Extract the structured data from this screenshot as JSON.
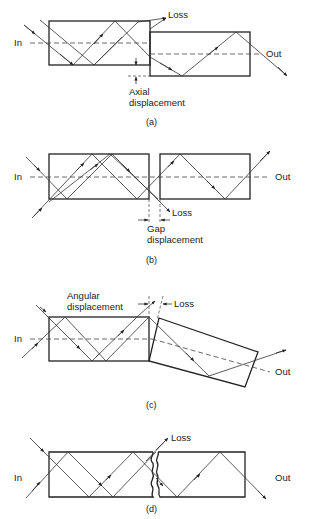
{
  "figure": {
    "panels": [
      {
        "id": "a",
        "caption": "(a)",
        "labels": {
          "in": "In",
          "out": "Out",
          "loss": "Loss",
          "displacement_line1": "Axial",
          "displacement_line2": "displacement"
        },
        "description": "Axial (lateral) displacement between two fiber ends"
      },
      {
        "id": "b",
        "caption": "(b)",
        "labels": {
          "in": "In",
          "out": "Out",
          "loss": "Loss",
          "displacement_line1": "Gap",
          "displacement_line2": "displacement"
        },
        "description": "Gap (longitudinal) displacement between two fiber ends"
      },
      {
        "id": "c",
        "caption": "(c)",
        "labels": {
          "in": "In",
          "out": "Out",
          "loss": "Loss",
          "displacement_line1": "Angular",
          "displacement_line2": "displacement"
        },
        "description": "Angular misalignment between two fiber ends"
      },
      {
        "id": "d",
        "caption": "(d)",
        "labels": {
          "in": "In",
          "out": "Out",
          "loss": "Loss"
        },
        "description": "Rough / poorly cleaved fiber end faces"
      }
    ]
  }
}
